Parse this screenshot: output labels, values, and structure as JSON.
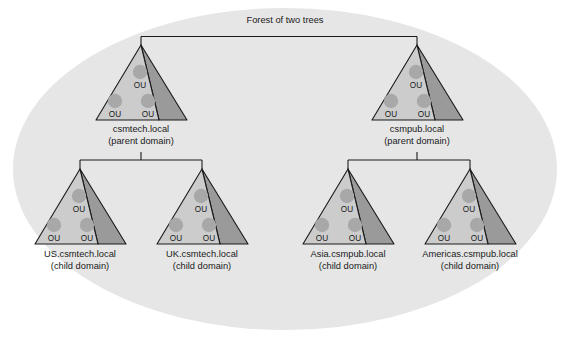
{
  "diagram": {
    "title": "Forest of two trees",
    "background_ellipse_color": "#e6e6e6",
    "canvas_color": "#ffffff",
    "cone_front_color": "#cccccc",
    "cone_side_color": "#9a9a9a",
    "ou_circle_color": "#a8a8a8",
    "line_color": "#1a1a1a",
    "ou_label": "OU",
    "parent_suffix": "(parent domain)",
    "child_suffix": "(child domain)",
    "trees": [
      {
        "id": "tree-csmtech",
        "root": {
          "name": "csmtech.local",
          "role": "(parent domain)",
          "ou_count": 3,
          "ou_labels": [
            "OU",
            "OU",
            "OU"
          ]
        },
        "children": [
          {
            "name": "US.csmtech.local",
            "role": "(child domain)",
            "ou_count": 3,
            "ou_labels": [
              "OU",
              "OU",
              "OU"
            ]
          },
          {
            "name": "UK.csmtech.local",
            "role": "(child domain)",
            "ou_count": 3,
            "ou_labels": [
              "OU",
              "OU",
              "OU"
            ]
          }
        ]
      },
      {
        "id": "tree-csmpub",
        "root": {
          "name": "csmpub.local",
          "role": "(parent domain)",
          "ou_count": 3,
          "ou_labels": [
            "OU",
            "OU",
            "OU"
          ]
        },
        "children": [
          {
            "name": "Asia.csmpub.local",
            "role": "(child domain)",
            "ou_count": 3,
            "ou_labels": [
              "OU",
              "OU",
              "OU"
            ]
          },
          {
            "name": "Americas.csmpub.local",
            "role": "(child domain)",
            "ou_count": 3,
            "ou_labels": [
              "OU",
              "OU",
              "OU"
            ]
          }
        ]
      }
    ]
  }
}
